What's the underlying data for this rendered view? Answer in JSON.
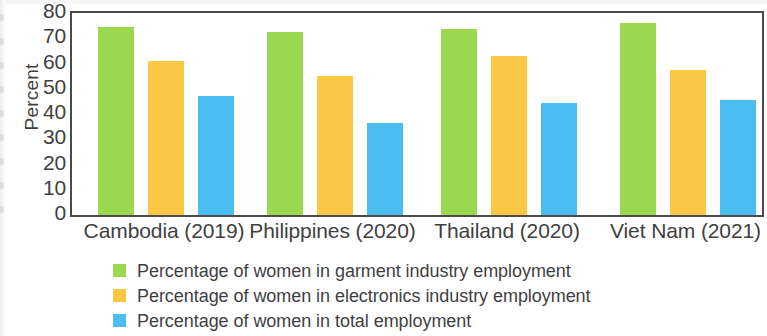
{
  "chart_data": {
    "type": "bar",
    "title": "",
    "xlabel": "",
    "ylabel": "Percent",
    "ylim": [
      0,
      80
    ],
    "ytick_step": 10,
    "yticks": [
      "80",
      "70",
      "60",
      "50",
      "40",
      "30",
      "20",
      "10",
      "0"
    ],
    "grid": false,
    "legend_position": "bottom-left",
    "categories": [
      "Cambodia (2019)",
      "Philippines (2020)",
      "Thailand (2020)",
      "Viet Nam (2021)"
    ],
    "series": [
      {
        "name": "Percentage of women in garment industry employment",
        "color": "#9ad94f",
        "values": [
          74.5,
          72.5,
          73.5,
          76
        ]
      },
      {
        "name": "Percentage of women in electronics industry employment",
        "color": "#fbc846",
        "values": [
          61,
          55,
          63,
          57.5
        ]
      },
      {
        "name": "Percentage of women in total employment",
        "color": "#4bbdf0",
        "values": [
          47,
          36.5,
          44.5,
          45.5
        ]
      }
    ]
  },
  "axis": {
    "y_title": "Percent",
    "y_tick_0": "80",
    "y_tick_1": "70",
    "y_tick_2": "60",
    "y_tick_3": "50",
    "y_tick_4": "40",
    "y_tick_5": "30",
    "y_tick_6": "20",
    "y_tick_7": "10",
    "y_tick_8": "0"
  },
  "x_axis": {
    "label_0": "Cambodia (2019)",
    "label_1": "Philippines (2020)",
    "label_2": "Thailand (2020)",
    "label_3": "Viet Nam (2021)"
  },
  "legend": {
    "item_0": "Percentage of women in garment industry employment",
    "item_1": "Percentage of women in electronics industry employment",
    "item_2": "Percentage of women in total employment"
  }
}
